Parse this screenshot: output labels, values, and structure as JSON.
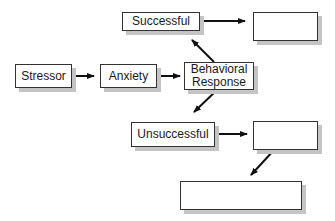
{
  "diagram": {
    "nodes": [
      {
        "id": "stressor",
        "label": "Stressor"
      },
      {
        "id": "anxiety",
        "label": "Anxiety"
      },
      {
        "id": "behavioral_response",
        "label_line1": "Behavioral",
        "label_line2": "Response"
      },
      {
        "id": "successful",
        "label": "Successful"
      },
      {
        "id": "successful_outcome",
        "label": ""
      },
      {
        "id": "unsuccessful",
        "label": "Unsuccessful"
      },
      {
        "id": "unsuccessful_outcome",
        "label": ""
      },
      {
        "id": "final_outcome",
        "label": ""
      }
    ],
    "edges": [
      {
        "from": "stressor",
        "to": "anxiety"
      },
      {
        "from": "anxiety",
        "to": "behavioral_response"
      },
      {
        "from": "behavioral_response",
        "to": "successful"
      },
      {
        "from": "behavioral_response",
        "to": "unsuccessful"
      },
      {
        "from": "successful",
        "to": "successful_outcome"
      },
      {
        "from": "unsuccessful",
        "to": "unsuccessful_outcome"
      },
      {
        "from": "unsuccessful_outcome",
        "to": "final_outcome"
      }
    ],
    "colors": {
      "stroke": "#333333",
      "shadow": "#c4c4c4",
      "fill": "#ffffff"
    }
  }
}
